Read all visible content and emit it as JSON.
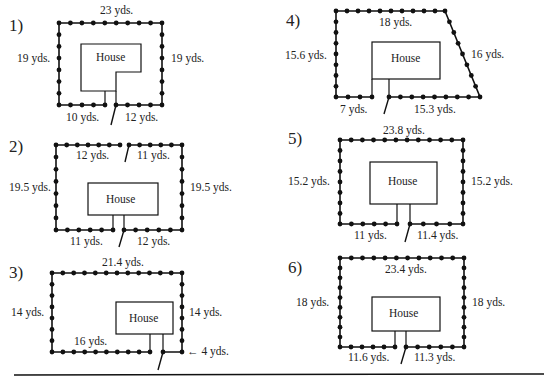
{
  "worksheet": {
    "problems": [
      {
        "number": "1)",
        "house_label": "House",
        "labels": {
          "top": "23 yds.",
          "left": "19 yds.",
          "right": "19 yds.",
          "bottom_left": "10 yds.",
          "bottom_right": "12 yds."
        }
      },
      {
        "number": "2)",
        "house_label": "House",
        "labels": {
          "top_left": "12 yds.",
          "top_right": "11 yds.",
          "left": "19.5 yds.",
          "right": "19.5 yds.",
          "bottom_left": "11 yds.",
          "bottom_right": "12 yds."
        }
      },
      {
        "number": "3)",
        "house_label": "House",
        "labels": {
          "top": "21.4 yds.",
          "left": "14 yds.",
          "right": "14 yds.",
          "bottom_left": "16 yds.",
          "bottom_right": "← 4 yds."
        }
      },
      {
        "number": "4)",
        "house_label": "House",
        "labels": {
          "top": "18 yds.",
          "left": "15.6 yds.",
          "right": "16 yds.",
          "bottom_left": "7 yds.",
          "bottom_right": "15.3 yds."
        }
      },
      {
        "number": "5)",
        "house_label": "House",
        "labels": {
          "top": "23.8 yds.",
          "left": "15.2 yds.",
          "right": "15.2 yds.",
          "bottom_left": "11 yds.",
          "bottom_right": "11.4 yds."
        }
      },
      {
        "number": "6)",
        "house_label": "House",
        "labels": {
          "top": "23.4 yds.",
          "left": "18 yds.",
          "right": "18 yds.",
          "bottom_left": "11.6 yds.",
          "bottom_right": "11.3 yds."
        }
      }
    ]
  }
}
